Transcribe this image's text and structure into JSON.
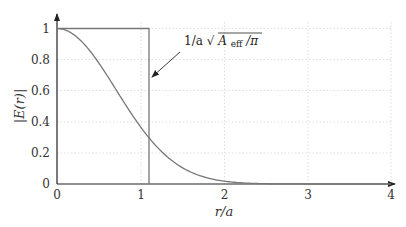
{
  "chart_data": {
    "type": "line",
    "title": "",
    "xlabel": "r/a",
    "ylabel": "|E(r)|",
    "xlim": [
      0,
      4
    ],
    "ylim": [
      0,
      1
    ],
    "grid": true,
    "x_ticks": [
      "0",
      "1",
      "2",
      "3",
      "4"
    ],
    "y_ticks": [
      "0",
      "0.2",
      "0.4",
      "0.6",
      "0.8",
      "1"
    ],
    "series": [
      {
        "name": "Gaussian field profile",
        "x": [
          0,
          0.25,
          0.5,
          0.75,
          1.0,
          1.25,
          1.5,
          1.75,
          2.0,
          2.25,
          2.5,
          2.75,
          3.0,
          3.5,
          4.0
        ],
        "y": [
          1.0,
          0.94,
          0.78,
          0.57,
          0.37,
          0.21,
          0.105,
          0.047,
          0.018,
          0.006,
          0.002,
          0.0005,
          0.0001,
          0.0,
          0.0
        ]
      },
      {
        "name": "Step (effective area) profile",
        "x": [
          0,
          1.1,
          1.1,
          4.0
        ],
        "y": [
          1,
          1,
          0,
          0
        ]
      }
    ],
    "annotations": [
      {
        "text": "1/a√A_eff/π",
        "points_to_x": 1.1,
        "points_to_y": 0.6
      }
    ]
  },
  "labels": {
    "xlabel_r": "r",
    "xlabel_slash": "/",
    "xlabel_a": "a",
    "ylabel": "|E(r)|",
    "annotation_prefix": "1/a",
    "annotation_A": "A",
    "annotation_sub": "eff",
    "annotation_suffix": "/π"
  }
}
